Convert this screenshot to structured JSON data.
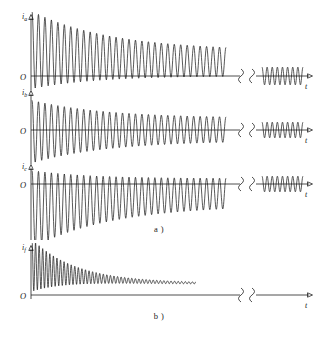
{
  "figure": {
    "title_a": "a )",
    "title_b": "b )",
    "origin_label": "O",
    "time_label": "t",
    "break_symbol": "axis-break-squiggle"
  },
  "panels": [
    {
      "id": "ia",
      "quantity": "i",
      "subscript": "a",
      "origin": "O",
      "time_label": "t",
      "group": "a"
    },
    {
      "id": "ib",
      "quantity": "i",
      "subscript": "b",
      "origin": "O",
      "time_label": "t",
      "group": "a"
    },
    {
      "id": "ic",
      "quantity": "i",
      "subscript": "c",
      "origin": "O",
      "time_label": "t",
      "group": "a"
    },
    {
      "id": "if",
      "quantity": "i",
      "subscript": "f",
      "origin": "O",
      "time_label": "t",
      "group": "b"
    }
  ],
  "chart_data": {
    "type": "line",
    "title": "",
    "xlabel": "t",
    "ylabel": "",
    "grid": false,
    "legend": "none",
    "axis_break": true,
    "series": [
      {
        "name": "i_a",
        "ylabel": "i_a",
        "description": "Phase-a short-circuit current: decaying DC offset with superimposed AC, envelope decays from peak toward steady-state symmetric oscillation",
        "dc_offset_initial": 0.62,
        "dc_offset_final": 0.3,
        "ac_amplitude_initial": 0.92,
        "ac_amplitude_final": 0.3,
        "cycles": 30,
        "steady_state_amplitude": 0.26,
        "steady_state_cycles": 8
      },
      {
        "name": "i_b",
        "ylabel": "i_b",
        "description": "Phase-b short-circuit current: nearly symmetric about zero, large initial amplitude decaying to steady state",
        "dc_offset_initial": -0.05,
        "dc_offset_final": 0.02,
        "ac_amplitude_initial": 0.95,
        "ac_amplitude_final": 0.34,
        "cycles": 30,
        "steady_state_amplitude": 0.26,
        "steady_state_cycles": 8
      },
      {
        "name": "i_c",
        "ylabel": "i_c",
        "description": "Phase-c short-circuit current: negative DC offset decaying upward toward zero with superimposed AC",
        "dc_offset_initial": -0.6,
        "dc_offset_final": -0.18,
        "ac_amplitude_initial": 0.92,
        "ac_amplitude_final": 0.32,
        "cycles": 30,
        "steady_state_amplitude": 0.26,
        "steady_state_cycles": 8
      },
      {
        "name": "i_f",
        "ylabel": "i_f",
        "description": "Field current: entirely positive, large initial ripple decaying to a constant steady value",
        "mean_initial": 0.48,
        "mean_final": 0.18,
        "ripple_initial": 0.42,
        "ripple_final": 0.01,
        "cycles": 46,
        "steady_value": 0.17
      }
    ]
  }
}
